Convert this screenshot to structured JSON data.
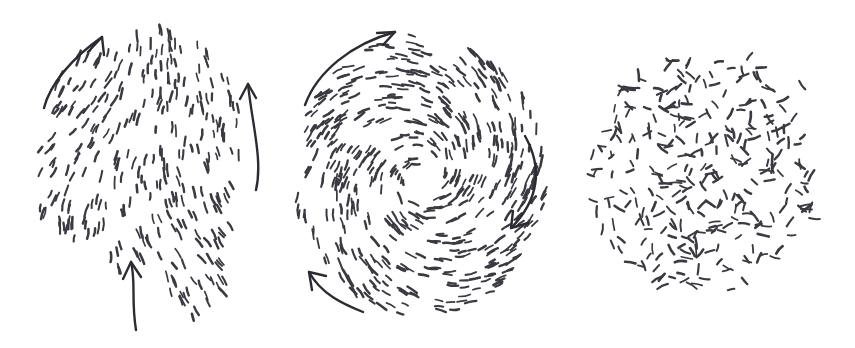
{
  "figure": {
    "background_color": "#ffffff",
    "width": 855,
    "height": 348,
    "panel_count": 3,
    "style": "hand-drawn ink sketch"
  },
  "style_tokens": {
    "dash_color": "#3a3a42",
    "dash_stroke_width": 2.0,
    "dash_length_min": 6,
    "dash_length_max": 12,
    "arrow_color": "#2b2b33",
    "arrow_stroke_width": 2.4
  },
  "panels": [
    {
      "id": "aligned",
      "name": "aligned-flow-panel",
      "order": 1,
      "pattern": "polar-aligned",
      "description": "Dashes aligned into coherent near-vertical streaming bands forming an irregular lobed blob with a lower-right tail.",
      "arrow_count": 3,
      "dash_count": 300,
      "blob_center_x": 150,
      "blob_center_y": 160,
      "arrows": [
        {
          "name": "arrow-upper-left",
          "direction": "up-right",
          "curvature": "convex-left",
          "label": ""
        },
        {
          "name": "arrow-right",
          "direction": "up",
          "curvature": "slight-bow",
          "label": ""
        },
        {
          "name": "arrow-bottom",
          "direction": "up",
          "curvature": "slight-bow",
          "label": ""
        }
      ]
    },
    {
      "id": "vortex",
      "name": "vortex-flow-panel",
      "order": 2,
      "pattern": "spiral-vortex",
      "description": "Dashes oriented tangentially around a central core, forming logarithmic spiral arms; a clear defect core at the centre.",
      "arrow_count": 3,
      "dash_count": 520,
      "blob_center_x": 135,
      "blob_center_y": 175,
      "core_radius": 8,
      "outer_radius": 120,
      "rotation_sense": "clockwise",
      "arrows": [
        {
          "name": "arrow-top-left",
          "direction": "up-right",
          "curvature": "arc-ccw",
          "label": ""
        },
        {
          "name": "arrow-right",
          "direction": "down",
          "curvature": "arc-cw",
          "label": ""
        },
        {
          "name": "arrow-bottom-left",
          "direction": "up-left",
          "curvature": "arc-cw",
          "label": ""
        }
      ]
    },
    {
      "id": "disordered",
      "name": "disordered-panel",
      "order": 3,
      "pattern": "isotropic-random",
      "description": "Dashes with uniformly random orientation filling a roughly circular blob with sparse scattered outliers to the right.",
      "arrow_count": 0,
      "dash_count": 300,
      "blob_center_x": 130,
      "blob_center_y": 175,
      "arrows": []
    }
  ],
  "chart_data": {
    "type": "scatter",
    "xlabel": "",
    "ylabel": "",
    "series": [
      {
        "name": "aligned-flow",
        "pattern": "polar-aligned",
        "glyph": "dash",
        "count": 300,
        "mean_orientation_deg": 95,
        "orientation_spread_deg": 22,
        "order_parameter": 0.86,
        "arrow_directions": [
          "up-right",
          "up",
          "up"
        ]
      },
      {
        "name": "vortex-flow",
        "pattern": "spiral-vortex",
        "glyph": "dash",
        "count": 520,
        "mean_orientation_deg": null,
        "orientation_spread_deg": 14,
        "order_parameter": 0.78,
        "arrow_directions": [
          "up-right",
          "down",
          "up-left"
        ]
      },
      {
        "name": "disordered",
        "pattern": "isotropic-random",
        "glyph": "dash",
        "count": 300,
        "mean_orientation_deg": null,
        "orientation_spread_deg": 104,
        "order_parameter": 0.04,
        "arrow_directions": []
      }
    ],
    "legend_position": "none",
    "grid": false
  }
}
